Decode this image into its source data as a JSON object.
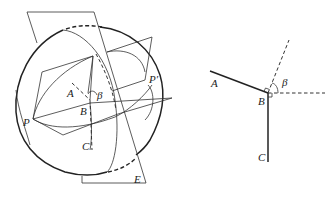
{
  "figure": {
    "left_panel": {
      "description": "Sphere intersected by planes through point B, great circles through P and P'",
      "labels": {
        "A": "A",
        "B": "B",
        "C": "C",
        "P": "P",
        "P_prime": "P′",
        "E": "E",
        "beta": "β"
      }
    },
    "right_panel": {
      "description": "Planar projection showing segments BA, BC with right-angle marks and angle β between dashed lines",
      "labels": {
        "A": "A",
        "B": "B",
        "C": "C",
        "beta": "β"
      }
    },
    "colors": {
      "stroke": "#222222",
      "background": "#ffffff"
    }
  }
}
